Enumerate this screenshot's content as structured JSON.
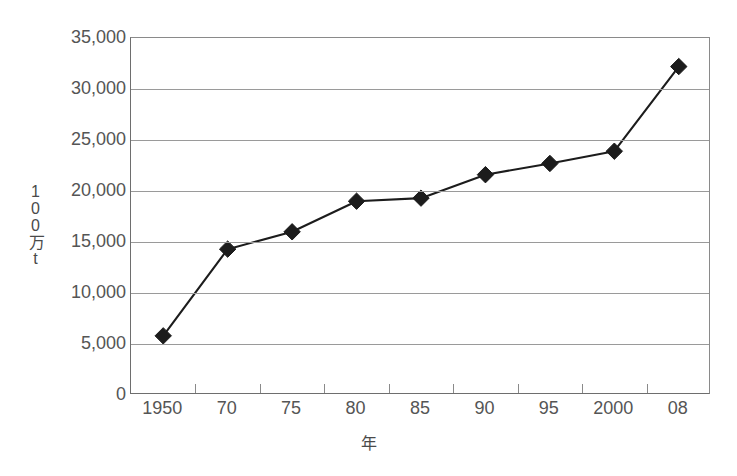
{
  "chart_data": {
    "type": "line",
    "title": "",
    "subtitle": "",
    "xlabel": "年",
    "ylabel": "100万t",
    "categories": [
      "1950",
      "70",
      "75",
      "80",
      "85",
      "90",
      "95",
      "2000",
      "08"
    ],
    "values": [
      5800,
      14300,
      16000,
      19000,
      19300,
      21600,
      22700,
      23900,
      32200
    ],
    "series": [
      {
        "name": "",
        "values": [
          5800,
          14300,
          16000,
          19000,
          19300,
          21600,
          22700,
          23900,
          32200
        ]
      }
    ],
    "ylim": [
      0,
      35000
    ],
    "ytick_values": [
      0,
      5000,
      10000,
      15000,
      20000,
      25000,
      30000,
      35000
    ],
    "ytick_labels": [
      "0",
      "5,000",
      "10,000",
      "15,000",
      "20,000",
      "25,000",
      "30,000",
      "35,000"
    ],
    "grid": "horizontal",
    "legend": "none",
    "marker": "diamond",
    "line_color": "#1c1c1c",
    "marker_color": "#1c1c1c",
    "gridline_color": "#9a9a9a",
    "axis_color": "#6e6e6e",
    "background_color": "#ffffff",
    "annotations": []
  }
}
